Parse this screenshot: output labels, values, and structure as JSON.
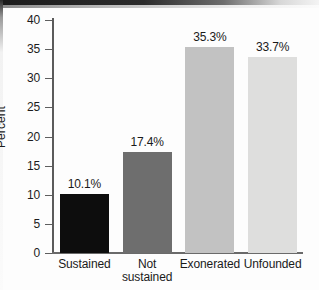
{
  "chart_data": {
    "type": "bar",
    "title": "",
    "subtitle": "",
    "xlabel": "",
    "ylabel": "Percent",
    "ylim": [
      0,
      40
    ],
    "grid": false,
    "legend": "none",
    "categories": [
      "Sustained",
      "Not sustained",
      "Exonerated",
      "Unfounded"
    ],
    "category_lines": [
      [
        "Sustained"
      ],
      [
        "Not",
        "sustained"
      ],
      [
        "Exonerated"
      ],
      [
        "Unfounded"
      ]
    ],
    "values": [
      10.1,
      17.4,
      35.3,
      33.7
    ],
    "data_labels": [
      "10.1%",
      "17.4%",
      "35.3%",
      "33.7%"
    ],
    "bar_colors": [
      "#0d0d0d",
      "#6e6e6e",
      "#c2c2c2",
      "#dededd"
    ],
    "y_ticks": [
      0,
      5,
      10,
      15,
      20,
      25,
      30,
      35,
      40
    ],
    "y_tick_labels": [
      "0",
      "5",
      "10",
      "15",
      "20",
      "25",
      "30",
      "35",
      "40"
    ]
  }
}
